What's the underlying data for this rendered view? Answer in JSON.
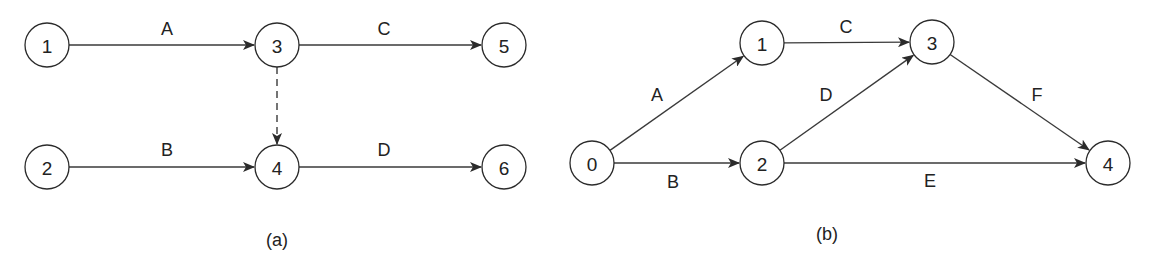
{
  "diagrams": [
    {
      "caption": "(a)",
      "caption_pos": [
        277,
        240
      ],
      "nodes": [
        {
          "id": "1",
          "label": "1",
          "x": 47,
          "y": 45
        },
        {
          "id": "3",
          "label": "3",
          "x": 277,
          "y": 45
        },
        {
          "id": "5",
          "label": "5",
          "x": 504,
          "y": 45
        },
        {
          "id": "2",
          "label": "2",
          "x": 47,
          "y": 167
        },
        {
          "id": "4",
          "label": "4",
          "x": 277,
          "y": 167
        },
        {
          "id": "6",
          "label": "6",
          "x": 504,
          "y": 167
        }
      ],
      "edges": [
        {
          "from": "1",
          "to": "3",
          "label": "A",
          "label_pos": [
            167,
            29
          ],
          "dashed": false
        },
        {
          "from": "3",
          "to": "5",
          "label": "C",
          "label_pos": [
            384,
            29
          ],
          "dashed": false
        },
        {
          "from": "3",
          "to": "4",
          "label": "",
          "label_pos": null,
          "dashed": true
        },
        {
          "from": "2",
          "to": "4",
          "label": "B",
          "label_pos": [
            167,
            150
          ],
          "dashed": false
        },
        {
          "from": "4",
          "to": "6",
          "label": "D",
          "label_pos": [
            384,
            150
          ],
          "dashed": false
        }
      ]
    },
    {
      "caption": "(b)",
      "caption_pos": [
        827,
        234
      ],
      "nodes": [
        {
          "id": "0",
          "label": "0",
          "x": 592,
          "y": 163
        },
        {
          "id": "1",
          "label": "1",
          "x": 762,
          "y": 43
        },
        {
          "id": "3",
          "label": "3",
          "x": 932,
          "y": 42
        },
        {
          "id": "2",
          "label": "2",
          "x": 762,
          "y": 163
        },
        {
          "id": "4",
          "label": "4",
          "x": 1108,
          "y": 163
        }
      ],
      "edges": [
        {
          "from": "0",
          "to": "1",
          "label": "A",
          "label_pos": [
            657,
            95
          ],
          "dashed": false
        },
        {
          "from": "0",
          "to": "2",
          "label": "B",
          "label_pos": [
            673,
            182
          ],
          "dashed": false
        },
        {
          "from": "1",
          "to": "3",
          "label": "C",
          "label_pos": [
            846,
            27
          ],
          "dashed": false
        },
        {
          "from": "2",
          "to": "3",
          "label": "D",
          "label_pos": [
            826,
            95
          ],
          "dashed": false
        },
        {
          "from": "2",
          "to": "4",
          "label": "E",
          "label_pos": [
            930,
            181
          ],
          "dashed": false
        },
        {
          "from": "3",
          "to": "4",
          "label": "F",
          "label_pos": [
            1037,
            95
          ],
          "dashed": false
        }
      ]
    }
  ],
  "style": {
    "node_radius": 22,
    "stroke_color": "#2b2b2b",
    "arrow_color": "#2b2b2b"
  }
}
